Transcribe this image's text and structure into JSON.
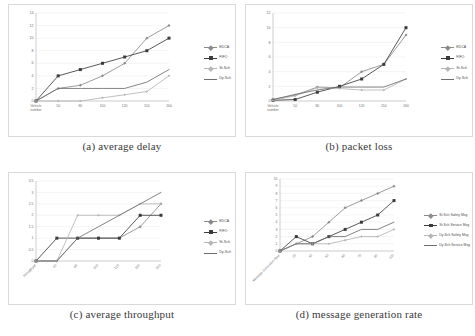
{
  "figure": {
    "background": "#ffffff",
    "panel_border": "#d9d9d9",
    "grid_color": "#e4e4e4",
    "axis_color": "#9a9a9a",
    "tick_text_color": "#6f6f6f"
  },
  "series_colors": {
    "edca": "#8a8a8a",
    "fifo": "#3b3b3b",
    "st_sch": "#b5b5b5",
    "dy_sch": "#6e6e6e",
    "st_safety": "#8a8a8a",
    "st_service": "#3b3b3b",
    "dy_safety": "#b5b5b5",
    "dy_service": "#6e6e6e"
  },
  "panels": [
    {
      "id": "a",
      "caption": "(a) average delay",
      "legend": [
        "EDCA",
        "FIFO",
        "St-Sch",
        "Dy-Sch"
      ]
    },
    {
      "id": "b",
      "caption": "(b) packet loss",
      "legend": [
        "EDCA",
        "FIFO",
        "St-Sch",
        "Dy-Sch"
      ]
    },
    {
      "id": "c",
      "caption": "(c) average throughput",
      "legend": [
        "EDCA",
        "FIFO",
        "St-Sch",
        "Dy-Sch"
      ]
    },
    {
      "id": "d",
      "caption": "(d) message generation rate",
      "legend": [
        "St-Sch Safety Msg",
        "St-Sch Service Msg",
        "Dy-Sch Safety Msg",
        "Dy-Sch Service Msg"
      ]
    }
  ],
  "chart_data": [
    {
      "type": "line",
      "title": "(a) average delay",
      "xlabel": "Vehicle number",
      "ylabel": "",
      "categories": [
        "Vehicle number",
        "50",
        "80",
        "100",
        "120",
        "150",
        "200"
      ],
      "ylim": [
        0,
        14
      ],
      "yticks": [
        0,
        2,
        4,
        6,
        8,
        10,
        12,
        14
      ],
      "grid": true,
      "legend_position": "right",
      "series": [
        {
          "name": "EDCA",
          "values": [
            0,
            2,
            2.5,
            4,
            6,
            10,
            12
          ]
        },
        {
          "name": "FIFO",
          "values": [
            0,
            4,
            5,
            6,
            7,
            8,
            10
          ]
        },
        {
          "name": "St-Sch",
          "values": [
            0,
            0,
            0,
            0.5,
            1,
            1.5,
            4
          ]
        },
        {
          "name": "Dy-Sch",
          "values": [
            0,
            2,
            2,
            2,
            2,
            3,
            5
          ]
        }
      ]
    },
    {
      "type": "line",
      "title": "(b) packet loss",
      "xlabel": "Vehicle number",
      "ylabel": "",
      "categories": [
        "Vehicle number",
        "50",
        "80",
        "100",
        "120",
        "150",
        "200"
      ],
      "ylim": [
        0,
        12
      ],
      "yticks": [
        0,
        2,
        4,
        6,
        8,
        10,
        12
      ],
      "grid": true,
      "legend_position": "right",
      "series": [
        {
          "name": "EDCA",
          "values": [
            0.2,
            0.8,
            1.9,
            1.8,
            4,
            5,
            9
          ]
        },
        {
          "name": "FIFO",
          "values": [
            0.1,
            0.2,
            1.2,
            2,
            3,
            5,
            10
          ]
        },
        {
          "name": "St-Sch",
          "values": [
            0.1,
            0.7,
            1.8,
            1.7,
            1.5,
            1.5,
            3
          ]
        },
        {
          "name": "Dy-Sch",
          "values": [
            0.2,
            0.9,
            1.5,
            1.9,
            1.9,
            1.9,
            3
          ]
        }
      ]
    },
    {
      "type": "line",
      "title": "(c) average throughput",
      "xlabel": "throughput",
      "ylabel": "",
      "categories": [
        "throughput",
        "50",
        "80",
        "100",
        "120",
        "150",
        "200"
      ],
      "ylim": [
        0,
        3.5
      ],
      "yticks": [
        0,
        0.5,
        1,
        1.5,
        2,
        2.5,
        3,
        3.5
      ],
      "grid": true,
      "legend_position": "right",
      "series": [
        {
          "name": "EDCA",
          "values": [
            0,
            0,
            1,
            1,
            1,
            1.5,
            2.5
          ]
        },
        {
          "name": "FIFO",
          "values": [
            0,
            1,
            1,
            1,
            1,
            2,
            2
          ]
        },
        {
          "name": "St-Sch",
          "values": [
            0,
            0,
            2,
            2,
            2,
            2.5,
            2.5
          ]
        },
        {
          "name": "Dy-Sch",
          "values": [
            0,
            0,
            1,
            1.5,
            2,
            2.5,
            3
          ]
        }
      ]
    },
    {
      "type": "line",
      "title": "(d) message generation rate",
      "xlabel": "Message Generation Rate",
      "ylabel": "",
      "categories": [
        "Message Generation Rate",
        "20",
        "40",
        "50",
        "60",
        "70",
        "80",
        "100"
      ],
      "ylim": [
        0,
        10
      ],
      "yticks": [
        0,
        1,
        2,
        3,
        4,
        5,
        6,
        7,
        8,
        9,
        10
      ],
      "grid": true,
      "legend_position": "right",
      "series": [
        {
          "name": "St-Sch Safety Msg",
          "values": [
            0,
            1,
            2,
            4,
            6,
            7,
            8,
            9
          ]
        },
        {
          "name": "St-Sch Service Msg",
          "values": [
            0,
            2,
            1,
            2,
            3,
            4,
            5,
            7
          ]
        },
        {
          "name": "Dy-Sch Safety Msg",
          "values": [
            0,
            1,
            1,
            1,
            1.5,
            2,
            2,
            3
          ]
        },
        {
          "name": "Dy-Sch Service Msg",
          "values": [
            0,
            1,
            1,
            2,
            2,
            3,
            3,
            4
          ]
        }
      ]
    }
  ]
}
